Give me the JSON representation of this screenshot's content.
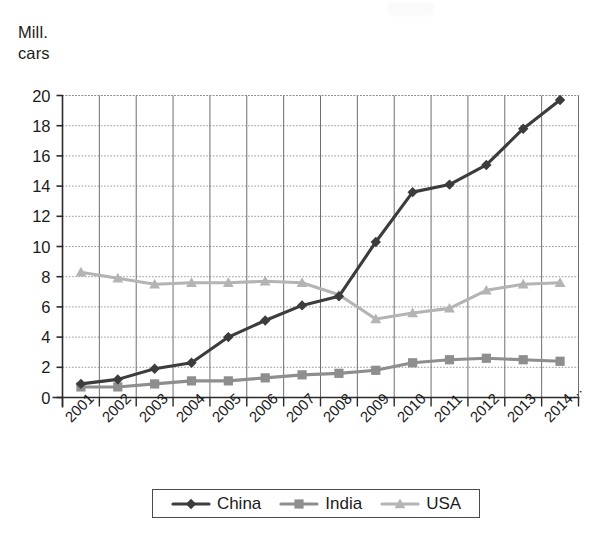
{
  "figure": {
    "y_axis_caption_line1": "Mill.",
    "y_axis_caption_line2": "cars"
  },
  "legend": {
    "position": "bottom",
    "entries": [
      {
        "label": "China",
        "color": "#3c3c3c",
        "marker": "diamond"
      },
      {
        "label": "India",
        "color": "#8e8e8e",
        "marker": "square"
      },
      {
        "label": "USA",
        "color": "#b4b4b4",
        "marker": "triangle"
      }
    ]
  },
  "chart_data": {
    "type": "line",
    "title": "",
    "subtitle": "",
    "xlabel": "",
    "ylabel": "Mill. cars",
    "x": [
      "2001",
      "2002",
      "2003",
      "2004",
      "2005",
      "2006",
      "2007",
      "2008",
      "2009",
      "2010",
      "2011",
      "2012",
      "2013",
      "2014..."
    ],
    "categories": [
      "2001",
      "2002",
      "2003",
      "2004",
      "2005",
      "2006",
      "2007",
      "2008",
      "2009",
      "2010",
      "2011",
      "2012",
      "2013",
      "2014..."
    ],
    "xtick_labels": [
      "2001",
      "2002",
      "2003",
      "2004",
      "2005",
      "2006",
      "2007",
      "2008",
      "2009",
      "2010",
      "2011",
      "2012",
      "2013",
      "2014..."
    ],
    "xtick_rotation": -45,
    "ytick_labels": [
      "0",
      "2",
      "4",
      "6",
      "8",
      "10",
      "12",
      "14",
      "16",
      "18",
      "20"
    ],
    "ytick_values": [
      0,
      2,
      4,
      6,
      8,
      10,
      12,
      14,
      16,
      18,
      20
    ],
    "ylim": [
      0,
      20
    ],
    "grid": {
      "horizontal": true,
      "vertical": true,
      "horizontal_style": "dotted",
      "vertical_style": "solid"
    },
    "legend_position": "bottom",
    "series": [
      {
        "name": "China",
        "color": "#3c3c3c",
        "marker": "diamond",
        "values": [
          0.9,
          1.2,
          1.9,
          2.3,
          4.0,
          5.1,
          6.1,
          6.7,
          10.3,
          13.6,
          14.1,
          15.4,
          17.8,
          19.7
        ]
      },
      {
        "name": "India",
        "color": "#8e8e8e",
        "marker": "square",
        "values": [
          0.7,
          0.7,
          0.9,
          1.1,
          1.1,
          1.3,
          1.5,
          1.6,
          1.8,
          2.3,
          2.5,
          2.6,
          2.5,
          2.4
        ]
      },
      {
        "name": "USA",
        "color": "#b4b4b4",
        "marker": "triangle",
        "values": [
          8.3,
          7.9,
          7.5,
          7.6,
          7.6,
          7.7,
          7.6,
          6.8,
          5.2,
          5.6,
          5.9,
          7.1,
          7.5,
          7.6
        ]
      }
    ]
  }
}
